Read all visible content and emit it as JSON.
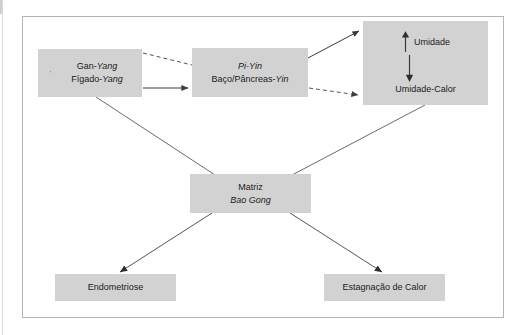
{
  "figure": {
    "type": "flow-diagram",
    "language": "pt-BR",
    "background": "#ffffff",
    "node_fill": "#d2d2d2",
    "line_color": "#444444",
    "frame_color": "#b4b4b4"
  },
  "nodes": {
    "gan_yang": {
      "id": "gan-yang",
      "line1_plain": "Gan-",
      "line1_italic": "Yang",
      "line2_plain": "Fígado-",
      "line2_italic": "Yang",
      "indicator": "up-arrow"
    },
    "pi_yin": {
      "id": "pi-yin",
      "line1_italic": "Pi-Yin",
      "line2_plain": "Baço/Pâncreas-",
      "line2_italic": "Yin"
    },
    "umidade": {
      "id": "umidade",
      "top_label": "Umidade",
      "top_indicator": "up-arrow",
      "inner_connector": "down-arrow",
      "bottom_label": "Umidade-Calor"
    },
    "matriz": {
      "id": "matriz",
      "line1_plain": "Matriz",
      "line2_italic": "Bao Gong"
    },
    "endometriose": {
      "id": "endometriose",
      "label": "Endometriose"
    },
    "estagnacao": {
      "id": "estagnacao-de-calor",
      "label": "Estagnação de Calor"
    }
  },
  "edges": [
    {
      "from": "gan-yang",
      "to": "pi-yin",
      "style": "dashed",
      "arrowhead": false,
      "note": "upper dashed connector"
    },
    {
      "from": "gan-yang",
      "to": "pi-yin",
      "style": "solid",
      "arrowhead": true,
      "note": "lower solid arrow"
    },
    {
      "from": "pi-yin",
      "to": "umidade",
      "style": "solid",
      "arrowhead": true,
      "note": "diagonal up-right to Umidade"
    },
    {
      "from": "pi-yin",
      "to": "umidade-calor",
      "style": "dashed",
      "arrowhead": true,
      "note": "diagonal down-right to Umidade-Calor"
    },
    {
      "from": "gan-yang",
      "to": "matriz",
      "style": "solid",
      "arrowhead": false,
      "note": "diagonal down-right"
    },
    {
      "from": "umidade",
      "to": "matriz",
      "style": "solid",
      "arrowhead": false,
      "note": "diagonal down-left"
    },
    {
      "from": "matriz",
      "to": "endometriose",
      "style": "solid",
      "arrowhead": true,
      "note": "diagonal down-left"
    },
    {
      "from": "matriz",
      "to": "estagnacao-de-calor",
      "style": "solid",
      "arrowhead": true,
      "note": "diagonal down-right"
    }
  ]
}
